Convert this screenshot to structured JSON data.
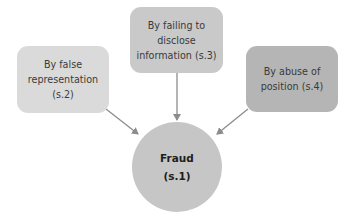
{
  "diagram": {
    "center": {
      "label": "Fraud\n(s.1)"
    },
    "nodes": [
      {
        "id": "left",
        "label": "By false\nrepresentation\n(s.2)",
        "color": "#dadada"
      },
      {
        "id": "top",
        "label": "By failing to\ndisclose\ninformation (s.3)",
        "color": "#c9c9c9"
      },
      {
        "id": "right",
        "label": "By abuse of\nposition (s.4)",
        "color": "#b5b5b5"
      }
    ],
    "arrow_color": "#8c8c8c",
    "center_color": "#c6c6c6"
  }
}
